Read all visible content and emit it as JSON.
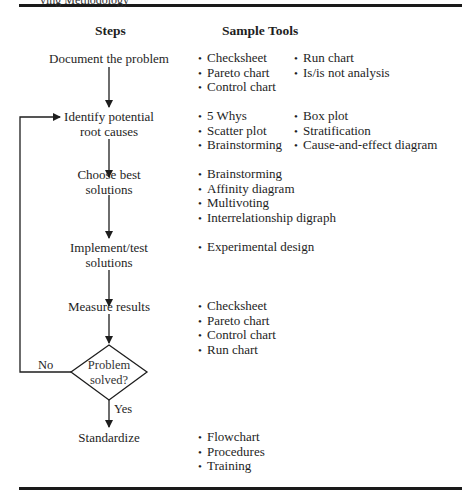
{
  "header": {
    "partial_top_text": "ving Methodology",
    "steps_heading": "Steps",
    "tools_heading": "Sample Tools"
  },
  "steps": [
    {
      "id": "document",
      "lines": [
        "Document the problem"
      ],
      "tools_col1": [
        "Checksheet",
        "Pareto chart",
        "Control chart"
      ],
      "tools_col2": [
        "Run chart",
        "Is/is not analysis"
      ]
    },
    {
      "id": "identify",
      "lines": [
        "Identify potential",
        "root causes"
      ],
      "tools_col1": [
        "5 Whys",
        "Scatter plot",
        "Brainstorming"
      ],
      "tools_col2": [
        "Box plot",
        "Stratification",
        "Cause-and-effect diagram"
      ]
    },
    {
      "id": "choose",
      "lines": [
        "Choose best",
        "solutions"
      ],
      "tools_col1": [
        "Brainstorming",
        "Affinity diagram",
        "Multivoting",
        "Interrelationship digraph"
      ],
      "tools_col2": []
    },
    {
      "id": "implement",
      "lines": [
        "Implement/test",
        "solutions"
      ],
      "tools_col1": [
        "Experimental design"
      ],
      "tools_col2": []
    },
    {
      "id": "measure",
      "lines": [
        "Measure results"
      ],
      "tools_col1": [
        "Checksheet",
        "Pareto chart",
        "Control chart",
        "Run chart"
      ],
      "tools_col2": []
    },
    {
      "id": "standardize",
      "lines": [
        "Standardize"
      ],
      "tools_col1": [
        "Flowchart",
        "Procedures",
        "Training"
      ],
      "tools_col2": []
    }
  ],
  "decision": {
    "lines": [
      "Problem",
      "solved?"
    ],
    "no_label": "No",
    "yes_label": "Yes"
  },
  "bullet": "•",
  "colors": {
    "ink": "#1e1e1e",
    "rule": "#1a1a1a",
    "background": "#ffffff"
  }
}
